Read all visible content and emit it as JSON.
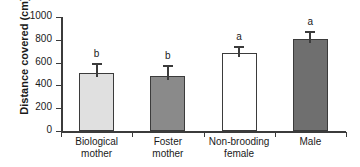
{
  "chart_data": {
    "type": "bar",
    "title": "",
    "subtitle": "",
    "xlabel": "",
    "ylabel": "Distance covered (cm)",
    "ylim": [
      0,
      1000
    ],
    "yticks": [
      0,
      200,
      400,
      600,
      800,
      1000
    ],
    "ytick_labels": [
      "0",
      "200",
      "400",
      "600",
      "800",
      "1000"
    ],
    "grid": false,
    "legend": false,
    "categories": [
      "Biological mother",
      "Foster mother",
      "Non-brooding female",
      "Male"
    ],
    "category_lines": [
      [
        "Biological",
        "mother"
      ],
      [
        "Foster",
        "mother"
      ],
      [
        "Non-brooding",
        "female"
      ],
      [
        "Male"
      ]
    ],
    "values": [
      505,
      485,
      685,
      805
    ],
    "errors": [
      90,
      90,
      60,
      75
    ],
    "annotations": [
      "b",
      "b",
      "a",
      "a"
    ],
    "bar_fills": [
      "#e0e0e0",
      "#8a8a8a",
      "#ffffff",
      "#6f6f6f"
    ],
    "bar_edge_color": "#3b3b3b",
    "axis_color": "#3b3b3b",
    "text_color": "#1a1a1a",
    "background": "#ffffff"
  }
}
